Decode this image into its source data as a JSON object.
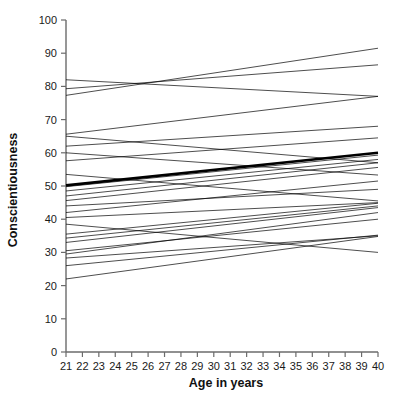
{
  "chart_data": {
    "type": "line",
    "title": "",
    "subtitle": "",
    "xlabel": "Age in years",
    "ylabel": "Conscientiousness",
    "xlim": [
      21,
      40
    ],
    "ylim": [
      0,
      100
    ],
    "xticks": [
      21,
      22,
      23,
      24,
      25,
      26,
      27,
      28,
      29,
      30,
      31,
      32,
      33,
      34,
      35,
      36,
      37,
      38,
      39,
      40
    ],
    "yticks": [
      0,
      10,
      20,
      30,
      40,
      50,
      60,
      70,
      80,
      90,
      100
    ],
    "xtick_labels": [
      "21",
      "22",
      "23",
      "24",
      "25",
      "26",
      "27",
      "28",
      "29",
      "30",
      "31",
      "32",
      "33",
      "34",
      "35",
      "36",
      "37",
      "38",
      "39",
      "40"
    ],
    "ytick_labels": [
      "0",
      "10",
      "20",
      "30",
      "40",
      "50",
      "60",
      "70",
      "80",
      "90",
      "100"
    ],
    "grid": false,
    "legend": false,
    "legend_position": "none",
    "x": [
      21,
      40
    ],
    "series": [
      {
        "name": "mean-trajectory",
        "emphasis": "bold",
        "values": [
          50.2,
          60.0
        ]
      },
      {
        "name": "subject-01",
        "emphasis": "thin",
        "values": [
          82.0,
          77.0
        ]
      },
      {
        "name": "subject-02",
        "emphasis": "thin",
        "values": [
          79.3,
          86.5
        ]
      },
      {
        "name": "subject-03",
        "emphasis": "thin",
        "values": [
          77.3,
          91.5
        ]
      },
      {
        "name": "subject-04",
        "emphasis": "thin",
        "values": [
          65.6,
          77.0
        ]
      },
      {
        "name": "subject-05",
        "emphasis": "thin",
        "values": [
          65.0,
          57.0
        ]
      },
      {
        "name": "subject-06",
        "emphasis": "thin",
        "values": [
          62.0,
          68.0
        ]
      },
      {
        "name": "subject-07",
        "emphasis": "thin",
        "values": [
          57.6,
          64.5
        ]
      },
      {
        "name": "subject-08",
        "emphasis": "thin",
        "values": [
          60.0,
          53.3
        ]
      },
      {
        "name": "subject-09",
        "emphasis": "thin",
        "values": [
          49.8,
          59.3
        ]
      },
      {
        "name": "subject-10",
        "emphasis": "thin",
        "values": [
          48.5,
          58.0
        ]
      },
      {
        "name": "subject-11",
        "emphasis": "thin",
        "values": [
          47.0,
          57.0
        ]
      },
      {
        "name": "subject-12",
        "emphasis": "thin",
        "values": [
          45.6,
          55.6
        ]
      },
      {
        "name": "subject-13",
        "emphasis": "thin",
        "values": [
          44.0,
          49.0
        ]
      },
      {
        "name": "subject-14",
        "emphasis": "thin",
        "values": [
          40.5,
          45.0
        ]
      },
      {
        "name": "subject-15",
        "emphasis": "thin",
        "values": [
          35.5,
          44.8
        ]
      },
      {
        "name": "subject-16",
        "emphasis": "thin",
        "values": [
          34.3,
          44.0
        ]
      },
      {
        "name": "subject-17",
        "emphasis": "thin",
        "values": [
          33.0,
          43.5
        ]
      },
      {
        "name": "subject-18",
        "emphasis": "thin",
        "values": [
          30.5,
          40.0
        ]
      },
      {
        "name": "subject-19",
        "emphasis": "thin",
        "values": [
          29.5,
          42.0
        ]
      },
      {
        "name": "subject-20",
        "emphasis": "thin",
        "values": [
          28.3,
          35.0
        ]
      },
      {
        "name": "subject-21",
        "emphasis": "thin",
        "values": [
          26.0,
          35.2
        ]
      },
      {
        "name": "subject-22",
        "emphasis": "thin",
        "values": [
          22.0,
          34.8
        ]
      },
      {
        "name": "subject-23",
        "emphasis": "thin",
        "values": [
          53.5,
          45.5
        ]
      },
      {
        "name": "subject-24",
        "emphasis": "thin",
        "values": [
          42.0,
          51.5
        ]
      },
      {
        "name": "subject-25",
        "emphasis": "thin",
        "values": [
          38.5,
          30.0
        ]
      }
    ]
  },
  "colors": {
    "axis": "#6b6b6b",
    "line": "#000000",
    "background": "#ffffff",
    "text": "#111111"
  }
}
